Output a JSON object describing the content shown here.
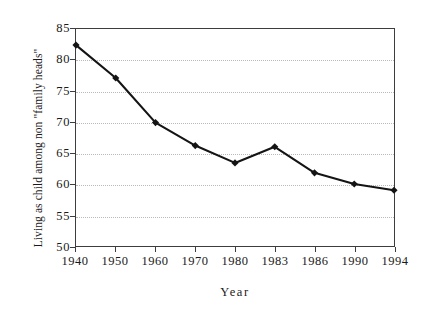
{
  "chart_data": {
    "type": "line",
    "title": "",
    "xlabel": "Year",
    "ylabel": "Living as child among non \"family heads\"",
    "categories": [
      "1940",
      "1950",
      "1960",
      "1970",
      "1980",
      "1983",
      "1986",
      "1990",
      "1994"
    ],
    "values": [
      82.4,
      77.1,
      69.9,
      66.2,
      63.4,
      66.0,
      61.8,
      60.0,
      59.0
    ],
    "series": [
      {
        "name": "Living as child among non \"family heads\"",
        "values": [
          82.4,
          77.1,
          69.9,
          66.2,
          63.4,
          66.0,
          61.8,
          60.0,
          59.0
        ]
      }
    ],
    "ylim": [
      50,
      85
    ],
    "ytick_labels": [
      "50",
      "55",
      "60",
      "65",
      "70",
      "75",
      "80",
      "85"
    ],
    "ytick_values": [
      50,
      55,
      60,
      65,
      70,
      75,
      80,
      85
    ],
    "xlim_categorical": true,
    "grid": "horizontal-dotted",
    "legend": "none",
    "marker": "diamond",
    "line_color": "#141414",
    "marker_color": "#141414",
    "grid_color": "#b9b9b9",
    "axis_color": "#3d3d3d",
    "background": "#ffffff"
  }
}
